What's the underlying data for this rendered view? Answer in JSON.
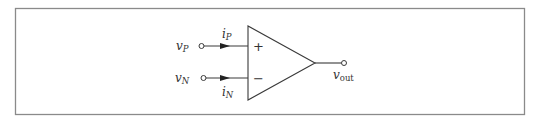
{
  "diagram": {
    "type": "op-amp schematic",
    "component": "operational amplifier",
    "inputs": [
      {
        "id": "noninverting",
        "voltage_label": {
          "base": "v",
          "subscript": "P"
        },
        "current_label": {
          "base": "i",
          "subscript": "P"
        },
        "sign": "+"
      },
      {
        "id": "inverting",
        "voltage_label": {
          "base": "v",
          "subscript": "N"
        },
        "current_label": {
          "base": "i",
          "subscript": "N"
        },
        "sign": "−"
      }
    ],
    "output": {
      "voltage_label": {
        "base": "v",
        "subscript": "out"
      }
    },
    "colors": {
      "frame": "#8a8a8a",
      "lines": "#3a3a3a",
      "text": "#333333",
      "background": "#ffffff"
    }
  }
}
